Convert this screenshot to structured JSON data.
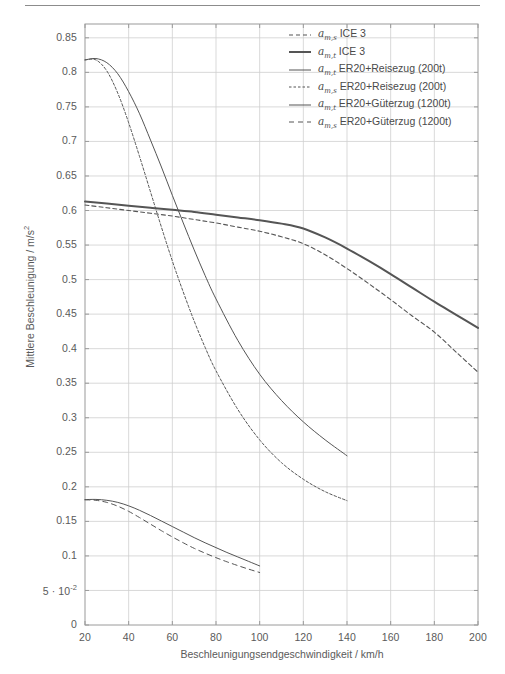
{
  "figure": {
    "has_header_rule": true,
    "background": "#ffffff",
    "line_color": "#555555",
    "grid_color": "#cfcfcf",
    "frame_color": "#9a9a9a"
  },
  "axes": {
    "xlabel": "Beschleunigungsendgeschwindigkeit / km/h",
    "ylabel_text": "Mittlere Beschleunigung / m/s",
    "ylabel_sup": "2",
    "xlim": [
      20,
      200
    ],
    "ylim": [
      0,
      0.87
    ],
    "xticks": [
      20,
      40,
      60,
      80,
      100,
      120,
      140,
      160,
      180,
      200
    ],
    "xticklabels": [
      "20",
      "40",
      "60",
      "80",
      "100",
      "120",
      "140",
      "160",
      "180",
      "200"
    ],
    "yticks": [
      0,
      0.05,
      0.1,
      0.15,
      0.2,
      0.25,
      0.3,
      0.35,
      0.4,
      0.45,
      0.5,
      0.55,
      0.6,
      0.65,
      0.7,
      0.75,
      0.8,
      0.85
    ],
    "yticklabels": [
      "0",
      "5 · 10⁻²",
      "0.1",
      "0.15",
      "0.2",
      "0.25",
      "0.3",
      "0.35",
      "0.4",
      "0.45",
      "0.5",
      "0.55",
      "0.6",
      "0.65",
      "0.7",
      "0.75",
      "0.8",
      "0.85"
    ],
    "grid": true
  },
  "legend": {
    "position": "upper-right-inside",
    "entries": [
      {
        "symbol": "a",
        "sub": "m,s",
        "label": "ICE 3",
        "style": "dashed",
        "width": 1.1,
        "dash": "4,3"
      },
      {
        "symbol": "a",
        "sub": "m,t",
        "label": "ICE 3",
        "style": "solid",
        "width": 2.0,
        "dash": ""
      },
      {
        "symbol": "a",
        "sub": "m,t",
        "label": "ER20+Reisezug (200t)",
        "style": "solid",
        "width": 1.0,
        "dash": ""
      },
      {
        "symbol": "a",
        "sub": "m,s",
        "label": "ER20+Reisezug (200t)",
        "style": "dashed",
        "width": 1.0,
        "dash": "2.5,2"
      },
      {
        "symbol": "a",
        "sub": "m,t",
        "label": "ER20+Güterzug (1200t)",
        "style": "solid",
        "width": 1.0,
        "dash": ""
      },
      {
        "symbol": "a",
        "sub": "m,s",
        "label": "ER20+Güterzug (1200t)",
        "style": "dashed",
        "width": 1.0,
        "dash": "5,4"
      }
    ]
  },
  "chart_data": {
    "type": "line",
    "title": "",
    "xlabel": "Beschleunigungsendgeschwindigkeit / km/h",
    "ylabel": "Mittlere Beschleunigung / m/s^2",
    "xlim": [
      20,
      200
    ],
    "ylim": [
      0,
      0.87
    ],
    "grid": true,
    "legend_position": "upper right",
    "series": [
      {
        "name": "a_m,t ICE 3",
        "style": "solid",
        "linewidth": 2.0,
        "x": [
          20,
          30,
          40,
          50,
          60,
          70,
          80,
          90,
          100,
          110,
          120,
          130,
          140,
          150,
          160,
          170,
          180,
          190,
          200
        ],
        "y": [
          0.613,
          0.61,
          0.607,
          0.604,
          0.601,
          0.598,
          0.594,
          0.59,
          0.586,
          0.581,
          0.574,
          0.561,
          0.545,
          0.527,
          0.508,
          0.488,
          0.468,
          0.449,
          0.43
        ]
      },
      {
        "name": "a_m,s ICE 3",
        "style": "dashed",
        "linewidth": 1.1,
        "x": [
          20,
          30,
          40,
          50,
          60,
          70,
          80,
          90,
          100,
          110,
          120,
          130,
          140,
          150,
          160,
          170,
          180,
          190,
          200
        ],
        "y": [
          0.608,
          0.604,
          0.6,
          0.596,
          0.592,
          0.587,
          0.582,
          0.576,
          0.57,
          0.562,
          0.552,
          0.536,
          0.516,
          0.494,
          0.471,
          0.447,
          0.424,
          0.395,
          0.366
        ]
      },
      {
        "name": "a_m,t ER20+Reisezug (200t)",
        "style": "solid",
        "linewidth": 1.0,
        "x": [
          20,
          25,
          30,
          35,
          40,
          45,
          50,
          55,
          60,
          65,
          70,
          75,
          80,
          90,
          100,
          110,
          120,
          130,
          140
        ],
        "y": [
          0.818,
          0.82,
          0.814,
          0.798,
          0.772,
          0.74,
          0.702,
          0.663,
          0.622,
          0.582,
          0.543,
          0.506,
          0.472,
          0.412,
          0.363,
          0.325,
          0.294,
          0.268,
          0.245
        ]
      },
      {
        "name": "a_m,s ER20+Reisezug (200t)",
        "style": "dashed",
        "linewidth": 1.0,
        "x": [
          20,
          25,
          30,
          35,
          40,
          45,
          50,
          55,
          60,
          65,
          70,
          75,
          80,
          90,
          100,
          110,
          120,
          130,
          140
        ],
        "y": [
          0.818,
          0.818,
          0.802,
          0.77,
          0.727,
          0.678,
          0.627,
          0.576,
          0.527,
          0.482,
          0.44,
          0.402,
          0.368,
          0.312,
          0.268,
          0.235,
          0.211,
          0.193,
          0.18
        ]
      },
      {
        "name": "a_m,t ER20+Güterzug (1200t)",
        "style": "solid",
        "linewidth": 1.0,
        "x": [
          20,
          25,
          30,
          35,
          40,
          45,
          50,
          55,
          60,
          65,
          70,
          75,
          80,
          85,
          90,
          95,
          100
        ],
        "y": [
          0.1815,
          0.1818,
          0.1805,
          0.1775,
          0.1725,
          0.166,
          0.1585,
          0.1505,
          0.1425,
          0.1345,
          0.1265,
          0.119,
          0.112,
          0.105,
          0.0985,
          0.092,
          0.0855
        ]
      },
      {
        "name": "a_m,s ER20+Güterzug (1200t)",
        "style": "dashed",
        "linewidth": 1.0,
        "x": [
          20,
          25,
          30,
          35,
          40,
          45,
          50,
          55,
          60,
          65,
          70,
          75,
          80,
          85,
          90,
          95,
          100
        ],
        "y": [
          0.1812,
          0.1805,
          0.1775,
          0.172,
          0.1645,
          0.1555,
          0.146,
          0.1365,
          0.1275,
          0.119,
          0.111,
          0.104,
          0.0975,
          0.0915,
          0.086,
          0.0808,
          0.076
        ]
      }
    ]
  }
}
